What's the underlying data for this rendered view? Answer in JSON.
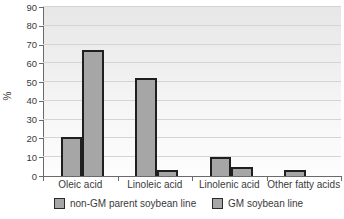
{
  "chart_data": {
    "type": "bar",
    "title": "",
    "xlabel": "",
    "ylabel": "%",
    "ylim": [
      0,
      90
    ],
    "ytick_step": 10,
    "ytick_labels": [
      "0",
      "10",
      "20",
      "30",
      "40",
      "50",
      "60",
      "70",
      "80",
      "90"
    ],
    "grid": true,
    "legend_position": "bottom",
    "categories": [
      "Oleic acid",
      "Linoleic acid",
      "Linolenic acid",
      "Other fatty acids"
    ],
    "series": [
      {
        "name": "non-GM parent soybean line",
        "values": [
          21,
          52,
          10,
          3
        ]
      },
      {
        "name": "GM soybean line",
        "values": [
          67,
          3,
          5,
          0
        ]
      }
    ],
    "colors": {
      "bar_fill": "#a6a6a6",
      "bar_border": "#1f1f1f",
      "gridline": "#d4d4d4",
      "axis": "#6a6a6a",
      "text": "#3a3a3a"
    }
  }
}
